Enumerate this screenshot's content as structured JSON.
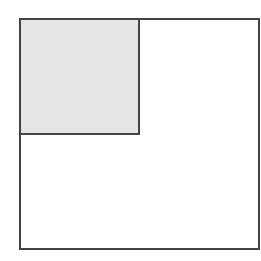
{
  "diagram": {
    "outer_square": {
      "x": 19,
      "y": 18,
      "width": 241,
      "height": 232,
      "fill": "#ffffff",
      "stroke": "#444444"
    },
    "inner_square": {
      "x": 19,
      "y": 18,
      "width": 121,
      "height": 117,
      "fill": "#e6e6e6",
      "stroke": "#444444"
    }
  }
}
